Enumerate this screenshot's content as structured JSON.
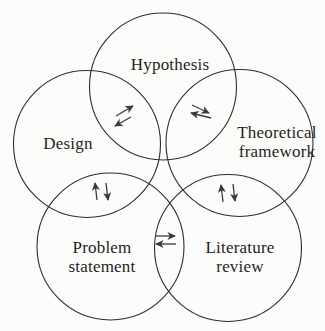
{
  "diagram": {
    "type": "venn-flower",
    "nodes": [
      {
        "id": "hypothesis",
        "label": "Hypothesis"
      },
      {
        "id": "design",
        "label": "Design"
      },
      {
        "id": "theoretical-framework",
        "label": "Theoretical framework"
      },
      {
        "id": "problem-statement",
        "label": "Problem statement"
      },
      {
        "id": "literature-review",
        "label": "Literature review"
      }
    ],
    "relationships": [
      {
        "from": "Design",
        "to": "Hypothesis",
        "bidirectional": true,
        "icon": "diagonal-exchange-arrows"
      },
      {
        "from": "Hypothesis",
        "to": "Theoretical framework",
        "bidirectional": true,
        "icon": "diagonal-exchange-arrows"
      },
      {
        "from": "Design",
        "to": "Problem statement",
        "bidirectional": true,
        "icon": "vertical-exchange-arrows"
      },
      {
        "from": "Theoretical framework",
        "to": "Literature review",
        "bidirectional": true,
        "icon": "vertical-exchange-arrows"
      },
      {
        "from": "Problem statement",
        "to": "Literature review",
        "bidirectional": true,
        "icon": "horizontal-exchange-arrows"
      }
    ],
    "colors": {
      "circle_stroke": "#2e2e2e",
      "arrow": "#3a3a3a",
      "text": "#1f1f1f",
      "background": "#fcfcfa"
    }
  }
}
